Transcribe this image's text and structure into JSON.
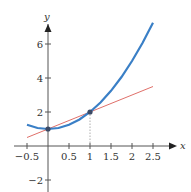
{
  "chart_data": {
    "type": "line",
    "title": "",
    "xlabel": "x",
    "ylabel": "y",
    "xlim": [
      -0.5,
      2.75
    ],
    "ylim": [
      -2.5,
      7.5
    ],
    "grid": false,
    "legend": null,
    "x_ticks": [
      -0.5,
      0.5,
      1,
      1.5,
      2,
      2.5
    ],
    "x_tick_labels": [
      "−0.5",
      "0.5",
      "1",
      "1.5",
      "2",
      "2.5"
    ],
    "y_ticks": [
      -2,
      2,
      4,
      6
    ],
    "y_tick_labels": [
      "−2",
      "2",
      "4",
      "6"
    ],
    "series": [
      {
        "name": "curve",
        "color": "#3a7fc6",
        "x": [
          -0.5,
          -0.25,
          0,
          0.25,
          0.5,
          0.75,
          1,
          1.25,
          1.5,
          1.75,
          2,
          2.25,
          2.5
        ],
        "values": [
          1.25,
          1.06,
          1.0,
          1.06,
          1.25,
          1.56,
          2.0,
          2.56,
          3.25,
          4.06,
          5.0,
          6.06,
          7.25
        ]
      },
      {
        "name": "secant line",
        "color": "#e0706a",
        "x": [
          -0.5,
          2.5
        ],
        "values": [
          0.5,
          3.5
        ]
      }
    ],
    "points": [
      {
        "x": 0,
        "y": 1,
        "label": "(0,1)"
      },
      {
        "x": 1,
        "y": 2,
        "label": "(1,2)"
      }
    ],
    "annotations": [
      {
        "type": "dotted-vertical",
        "x": 1,
        "from_y": 0,
        "to_y": 2
      }
    ]
  }
}
